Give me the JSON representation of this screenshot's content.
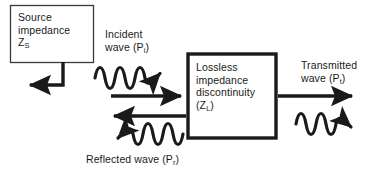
{
  "diagram": {
    "colors": {
      "stroke": "#1a1a1a",
      "thin_stroke": "#3a3a3a",
      "background": "#ffffff",
      "text": "#1a1a1a"
    },
    "source_box": {
      "line1": "Source",
      "line2": "impedance",
      "symbol": "Z",
      "symbol_subscript": "S"
    },
    "main_box": {
      "line1": "Lossless",
      "line2": "impedance",
      "line3": "discontinuity",
      "symbol_open": "(Z",
      "symbol_subscript": "L",
      "symbol_close": ")"
    },
    "incident_wave": {
      "line1": "Incident",
      "line2": "wave (P",
      "subscript": "i",
      "line2_end": ")"
    },
    "reflected_wave": {
      "text": "Reflected wave (P",
      "subscript": "r",
      "text_end": ")"
    },
    "transmitted_wave": {
      "line1": "Transmitted",
      "line2": "wave (P",
      "subscript": "t",
      "line2_end": ")"
    },
    "arrows": {
      "source_return": "source-return-elbow-arrow",
      "incident_wavy": "incident-wavy-arrow-right",
      "incident_straight": "incident-straight-arrow-right",
      "reflected_straight": "reflected-straight-arrow-left",
      "reflected_wavy": "reflected-wavy-arrow-left",
      "transmitted_straight": "transmitted-straight-arrow-right",
      "transmitted_wavy": "transmitted-wavy-arrow-right"
    }
  }
}
